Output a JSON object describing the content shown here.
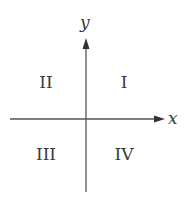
{
  "axes": {
    "x_label": "x",
    "y_label": "y",
    "color": "#555555"
  },
  "quadrants": [
    {
      "id": "I",
      "label": "I"
    },
    {
      "id": "II",
      "label": "II"
    },
    {
      "id": "III",
      "label": "III"
    },
    {
      "id": "IV",
      "label": "IV"
    }
  ]
}
